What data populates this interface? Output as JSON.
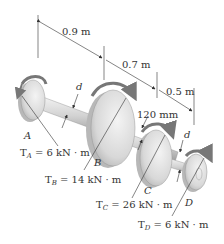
{
  "diagram": {
    "type": "shaft-torque",
    "dimensions": {
      "AB": "0.9 m",
      "BC": "0.7 m",
      "CD": "0.5 m",
      "gear_c_offset": "120 mm"
    },
    "diameter_label": "d",
    "disks": [
      {
        "id": "A",
        "label": "A",
        "torque_name": "T",
        "torque_sub": "A",
        "torque_value": "= 6 kN · m"
      },
      {
        "id": "B",
        "label": "B",
        "torque_name": "T",
        "torque_sub": "B",
        "torque_value": "= 14 kN · m"
      },
      {
        "id": "C",
        "label": "C",
        "torque_name": "T",
        "torque_sub": "C",
        "torque_value": "= 26 kN · m"
      },
      {
        "id": "D",
        "label": "D",
        "torque_name": "T",
        "torque_sub": "D",
        "torque_value": "= 6 kN · m"
      }
    ]
  },
  "colors": {
    "line": "#333333",
    "disk_light": "#e8e8e8",
    "disk_mid": "#c8c8c8",
    "disk_dark": "#9a9a9a",
    "arrow": "#7a7a7a"
  }
}
